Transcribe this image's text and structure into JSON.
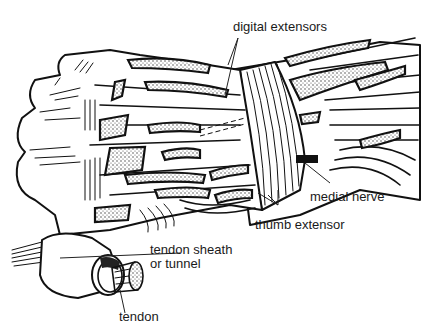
{
  "figure": {
    "labels": {
      "digital_extensors": "digital extensors",
      "medial_nerve": "medial nerve",
      "thumb_extensor": "thumb extensor",
      "tendon_sheath_line1": "tendon sheath",
      "tendon_sheath_line2": "or tunnel",
      "tendon": "tendon"
    },
    "colors": {
      "ink": "#111111",
      "background": "#ffffff"
    }
  }
}
